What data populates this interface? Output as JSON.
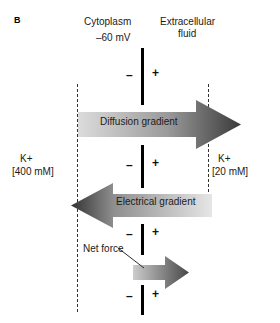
{
  "figure": {
    "panel_letter": "B",
    "type": "cell-membrane-ion-gradient-diagram"
  },
  "labels": {
    "cytoplasm": "Cytoplasm",
    "membrane_potential": "–60 mV",
    "extracellular_line1": "Extracellular",
    "extracellular_line2": "fluid",
    "k_left_ion": "K+",
    "k_left_concentration": "[400 mM]",
    "k_right_ion": "K+",
    "k_right_concentration": "[20 mM]",
    "net_force": "Net force"
  },
  "arrows": [
    {
      "name": "diffusion-gradient",
      "label": "Diffusion gradient",
      "direction": "right",
      "gradient_from": "#dcdcdc",
      "gradient_to": "#3a3a3a"
    },
    {
      "name": "electrical-gradient",
      "label": "Electrical gradient",
      "direction": "left",
      "gradient_from": "#3a3a3a",
      "gradient_to": "#e3e3e3"
    },
    {
      "name": "net-force",
      "label": "Net force",
      "direction": "right",
      "gradient_from": "#c9c9c9",
      "gradient_to": "#4a4a4a"
    }
  ],
  "charges": {
    "negative_symbol": "–",
    "positive_symbol": "+",
    "negative_side": "cytoplasm",
    "positive_side": "extracellular fluid",
    "pair_count": 4
  },
  "colors": {
    "membrane": "#000000",
    "dashed_boundary": "#333333",
    "text": "#1a1a1a",
    "background": "#ffffff"
  }
}
